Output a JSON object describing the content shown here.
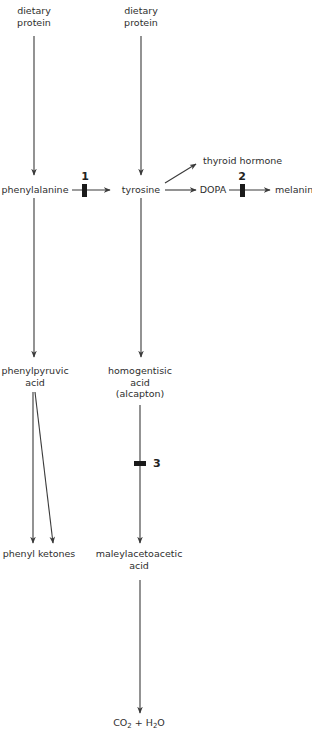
{
  "nodes": {
    "dietary_protein_1": [
      "dietary",
      "protein"
    ],
    "dietary_protein_2": [
      "dietary",
      "protein"
    ],
    "phenylalanine": "phenylalanine",
    "tyrosine": "tyrosine",
    "thyroid_hormone": "thyroid hormone",
    "dopa": "DOPA",
    "melanin": "melanin",
    "phenylpyruvic_acid": [
      "phenylpyruvic",
      "acid"
    ],
    "homogentisic_acid": [
      "homogentisic",
      "acid",
      "(alcapton)"
    ],
    "phenyl_ketones": "phenyl ketones",
    "maleylacetoacetic_acid": [
      "maleylacetoacetic",
      "acid"
    ],
    "co2_h2o": {
      "co": "CO",
      "sub1": "2",
      "plus": " + H",
      "sub2": "2",
      "o": "O"
    }
  },
  "blocks": {
    "block_1": "1",
    "block_2": "2",
    "block_3": "3"
  },
  "colors": {
    "line": "#3a3a3a",
    "block": "#1a1a1a",
    "text": "#2e2e2e"
  }
}
